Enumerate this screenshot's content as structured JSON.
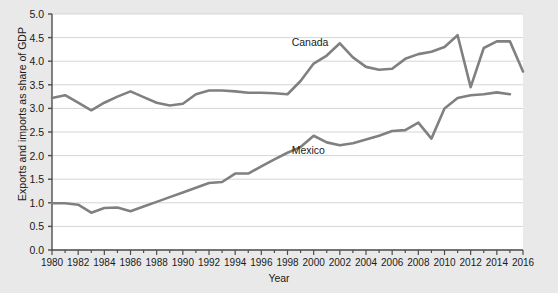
{
  "chart_data": {
    "type": "line",
    "title": "",
    "xlabel": "Year",
    "ylabel": "Exports and imports as share of GDP",
    "xlim": [
      1980,
      2016
    ],
    "ylim": [
      0.0,
      5.0
    ],
    "grid": true,
    "legend_position": "inline-labels",
    "ytick_labels": [
      "0.0",
      "0.5",
      "1.0",
      "1.5",
      "2.0",
      "2.5",
      "3.0",
      "3.5",
      "4.0",
      "4.5",
      "5.0"
    ],
    "ytick_values": [
      0.0,
      0.5,
      1.0,
      1.5,
      2.0,
      2.5,
      3.0,
      3.5,
      4.0,
      4.5,
      5.0
    ],
    "xtick_labels": [
      "1980",
      "1982",
      "1984",
      "1986",
      "1988",
      "1990",
      "1992",
      "1994",
      "1996",
      "1998",
      "2000",
      "2002",
      "2004",
      "2006",
      "2008",
      "2010",
      "2012",
      "2014",
      "2016"
    ],
    "xtick_values": [
      1980,
      1982,
      1984,
      1986,
      1988,
      1990,
      1992,
      1994,
      1996,
      1998,
      2000,
      2002,
      2004,
      2006,
      2008,
      2010,
      2012,
      2014,
      2016
    ],
    "x": [
      1980,
      1981,
      1982,
      1983,
      1984,
      1985,
      1986,
      1987,
      1988,
      1989,
      1990,
      1991,
      1992,
      1993,
      1994,
      1995,
      1996,
      1997,
      1998,
      1999,
      2000,
      2001,
      2002,
      2003,
      2004,
      2005,
      2006,
      2007,
      2008,
      2009,
      2010,
      2011,
      2012,
      2013,
      2014,
      2015
    ],
    "series": [
      {
        "name": "Canada",
        "color": "#808080",
        "label_x": 2000,
        "label_y": 4.38,
        "values": [
          3.22,
          3.28,
          3.12,
          2.96,
          3.12,
          3.25,
          3.36,
          3.24,
          3.12,
          3.06,
          3.1,
          3.3,
          3.38,
          3.38,
          3.36,
          3.33,
          3.33,
          3.32,
          3.3,
          3.58,
          3.95,
          4.12,
          4.18,
          4.02,
          3.9,
          4.16,
          4.25,
          4.4,
          4.13,
          4.02,
          4.32,
          4.44,
          4.55,
          3.45,
          4.18,
          4.42
        ]
      },
      {
        "name": "Mexico",
        "color": "#808080",
        "label_x": 2000,
        "label_y": 2.1,
        "values": [
          0.99,
          0.99,
          0.96,
          0.79,
          0.89,
          0.9,
          0.82,
          0.92,
          1.02,
          1.12,
          1.22,
          1.32,
          1.42,
          1.44,
          1.62,
          1.62,
          1.77,
          1.92,
          2.06,
          2.18,
          2.42,
          2.28,
          2.22,
          2.26,
          2.34,
          2.42,
          2.52,
          2.54,
          2.7,
          2.36,
          3.0,
          3.22,
          3.28,
          3.3,
          3.34,
          3.3
        ]
      }
    ],
    "series_rendered": [
      {
        "name": "Canada",
        "points": [
          [
            1980,
            3.22
          ],
          [
            1981,
            3.28
          ],
          [
            1982,
            3.12
          ],
          [
            1983,
            2.96
          ],
          [
            1984,
            3.12
          ],
          [
            1985,
            3.25
          ],
          [
            1986,
            3.36
          ],
          [
            1987,
            3.24
          ],
          [
            1988,
            3.12
          ],
          [
            1989,
            3.06
          ],
          [
            1990,
            3.1
          ],
          [
            1991,
            3.3
          ],
          [
            1992,
            3.38
          ],
          [
            1993,
            3.38
          ],
          [
            1994,
            3.36
          ],
          [
            1995,
            3.33
          ],
          [
            1996,
            3.33
          ],
          [
            1997,
            3.32
          ],
          [
            1998,
            3.3
          ],
          [
            1999,
            3.58
          ],
          [
            2000,
            3.95
          ],
          [
            2001,
            4.12
          ],
          [
            2002,
            4.38
          ],
          [
            2003,
            4.08
          ],
          [
            2004,
            3.88
          ],
          [
            2005,
            3.82
          ],
          [
            2006,
            3.84
          ],
          [
            2007,
            4.05
          ],
          [
            2008,
            4.15
          ],
          [
            2009,
            4.2
          ],
          [
            2010,
            4.3
          ],
          [
            2011,
            4.55
          ],
          [
            2012,
            3.45
          ],
          [
            2013,
            4.28
          ],
          [
            2014,
            4.42
          ],
          [
            2015,
            4.42
          ],
          [
            2016,
            3.78
          ]
        ]
      },
      {
        "name": "Mexico",
        "points": [
          [
            1980,
            0.99
          ],
          [
            1981,
            0.99
          ],
          [
            1982,
            0.96
          ],
          [
            1983,
            0.79
          ],
          [
            1984,
            0.89
          ],
          [
            1985,
            0.9
          ],
          [
            1986,
            0.82
          ],
          [
            1987,
            0.92
          ],
          [
            1988,
            1.02
          ],
          [
            1989,
            1.12
          ],
          [
            1990,
            1.22
          ],
          [
            1991,
            1.32
          ],
          [
            1992,
            1.42
          ],
          [
            1993,
            1.44
          ],
          [
            1994,
            1.62
          ],
          [
            1995,
            1.62
          ],
          [
            1996,
            1.77
          ],
          [
            1997,
            1.92
          ],
          [
            1998,
            2.06
          ],
          [
            1999,
            2.18
          ],
          [
            2000,
            2.42
          ],
          [
            2001,
            2.28
          ],
          [
            2002,
            2.22
          ],
          [
            2003,
            2.26
          ],
          [
            2004,
            2.34
          ],
          [
            2005,
            2.42
          ],
          [
            2006,
            2.52
          ],
          [
            2007,
            2.54
          ],
          [
            2008,
            2.7
          ],
          [
            2009,
            2.36
          ],
          [
            2010,
            3.0
          ],
          [
            2011,
            3.22
          ],
          [
            2012,
            3.28
          ],
          [
            2013,
            3.3
          ],
          [
            2014,
            3.34
          ],
          [
            2015,
            3.3
          ]
        ]
      }
    ]
  },
  "colors": {
    "line": "#808080",
    "grid": "#d5d5d5",
    "axis": "#4d4d4d",
    "plot_bg": "#ffffff",
    "page_bg": "#e9e9e9",
    "text": "#1a1a1a"
  }
}
